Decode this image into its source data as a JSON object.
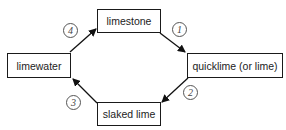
{
  "diagram": {
    "nodes": [
      {
        "id": "limestone",
        "label": "limestone"
      },
      {
        "id": "quicklime",
        "label": "quicklime (or lime)"
      },
      {
        "id": "slaked",
        "label": "slaked lime"
      },
      {
        "id": "limewater",
        "label": "limewater"
      }
    ],
    "steps": [
      {
        "number": "1",
        "from": "limestone",
        "to": "quicklime"
      },
      {
        "number": "2",
        "from": "quicklime",
        "to": "slaked"
      },
      {
        "number": "3",
        "from": "slaked",
        "to": "limewater"
      },
      {
        "number": "4",
        "from": "limewater",
        "to": "limestone"
      }
    ]
  }
}
